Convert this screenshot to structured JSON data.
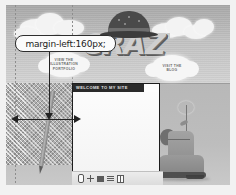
{
  "annotation": {
    "label": "margin-left:160px;",
    "measure_arrow_name": "margin-width-arrow",
    "pointer_arrow_name": "margin-left-pointer-arrow"
  },
  "hero": {
    "title_word": "CRAZY!",
    "hat_icon": "bowler-hat-illustration"
  },
  "nav_clouds": [
    {
      "id": "illustration-portfolio",
      "lines": [
        "VIEW THE",
        "ILLUSTRATION",
        "PORTFOLIO"
      ]
    },
    {
      "id": "blog",
      "lines": [
        "VISIT THE",
        "BLOG"
      ]
    }
  ],
  "panel": {
    "title": "WELCOME TO MY SITE",
    "body_text": ""
  },
  "toolbar": {
    "icons": [
      {
        "name": "pin-icon"
      },
      {
        "name": "plus-icon"
      },
      {
        "name": "square-icon"
      },
      {
        "name": "list-lines-icon"
      },
      {
        "name": "columns-icon"
      }
    ]
  },
  "decor": {
    "pencil": "pencil-illustration",
    "boot": "boot-with-flower-illustration"
  },
  "colors": {
    "annotation_border": "#2e2e2e",
    "annotation_bg": "#fbfbfb",
    "arrow": "#232323",
    "panel_border": "#1d1d1d",
    "panel_header": "#2b2b2b",
    "sky_top": "#a9a9a9",
    "ground": "#bdbdbd"
  }
}
